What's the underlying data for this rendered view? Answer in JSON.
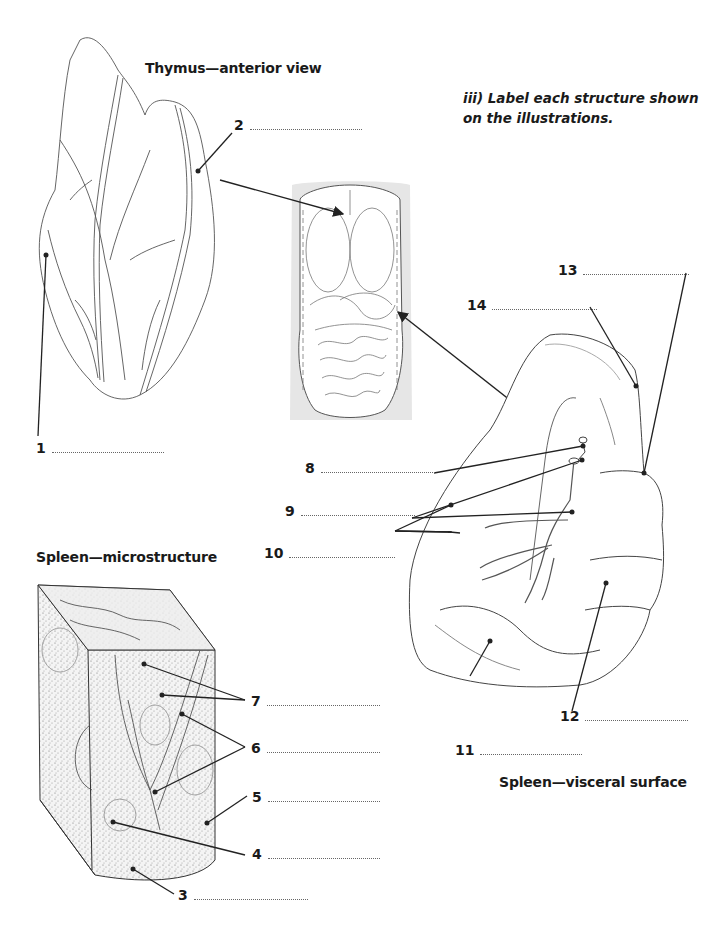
{
  "worksheet": {
    "instruction": {
      "line1": "iii) Label each structure shown",
      "line2": "on the illustrations."
    },
    "figures": [
      {
        "id": "thymus",
        "title": "Thymus—anterior view"
      },
      {
        "id": "torso",
        "title": ""
      },
      {
        "id": "spleen_visceral",
        "title": "Spleen—visceral surface"
      },
      {
        "id": "spleen_micro",
        "title": "Spleen—microstructure"
      }
    ],
    "labels": [
      {
        "n": "1",
        "answer": ""
      },
      {
        "n": "2",
        "answer": ""
      },
      {
        "n": "3",
        "answer": ""
      },
      {
        "n": "4",
        "answer": ""
      },
      {
        "n": "5",
        "answer": ""
      },
      {
        "n": "6",
        "answer": ""
      },
      {
        "n": "7",
        "answer": ""
      },
      {
        "n": "8",
        "answer": ""
      },
      {
        "n": "9",
        "answer": ""
      },
      {
        "n": "10",
        "answer": ""
      },
      {
        "n": "11",
        "answer": ""
      },
      {
        "n": "12",
        "answer": ""
      },
      {
        "n": "13",
        "answer": ""
      },
      {
        "n": "14",
        "answer": ""
      }
    ]
  }
}
